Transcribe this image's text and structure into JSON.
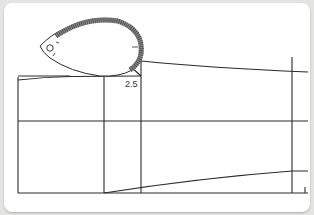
{
  "diagram": {
    "type": "sewing-pattern-draft",
    "label_measure": "2.5",
    "colors": {
      "background": "#e4e4e2",
      "paper": "#ffffff",
      "line": "#2a2a2a",
      "tape_fill": "#8a8a8a"
    },
    "elements": [
      {
        "name": "tape-measure-loop",
        "description": "teardrop-shaped tape measure curved around armhole"
      },
      {
        "name": "pattern-block",
        "description": "rectangular block with vertical and horizontal guide lines"
      }
    ]
  }
}
